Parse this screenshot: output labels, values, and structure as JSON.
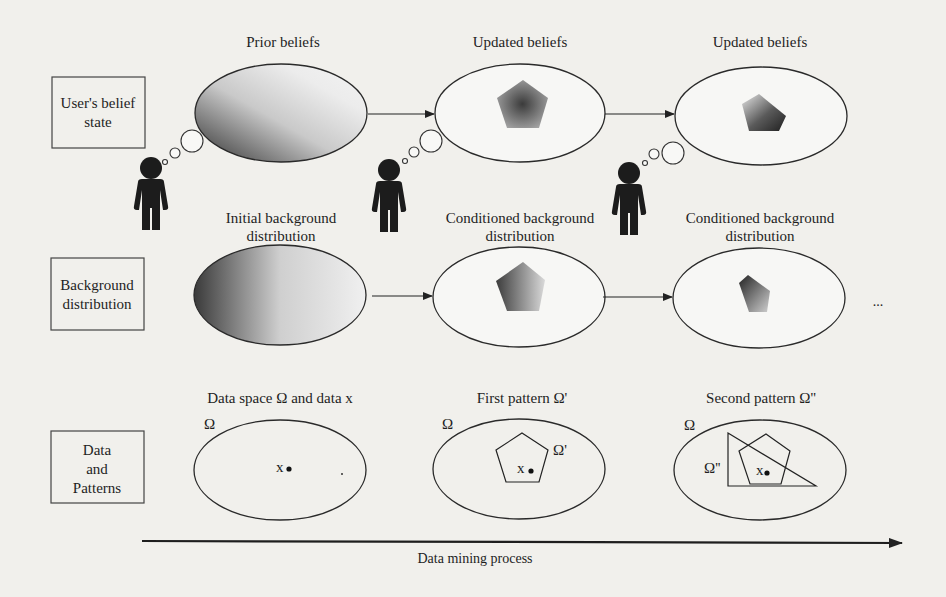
{
  "figure": {
    "rows": [
      {
        "id": "belief",
        "label_lines": [
          "User's belief",
          "state"
        ],
        "stages": [
          {
            "title_lines": [
              "Prior beliefs"
            ],
            "fill": "gradient-ellipse"
          },
          {
            "title_lines": [
              "Updated beliefs"
            ],
            "fill": "radial-pentagon"
          },
          {
            "title_lines": [
              "Updated beliefs"
            ],
            "fill": "cut-pentagon"
          }
        ]
      },
      {
        "id": "background",
        "label_lines": [
          "Background",
          "distribution"
        ],
        "stages": [
          {
            "title_lines": [
              "Initial background",
              "distribution"
            ],
            "fill": "gradient-ellipse"
          },
          {
            "title_lines": [
              "Conditioned background",
              "distribution"
            ],
            "fill": "gradient-pentagon"
          },
          {
            "title_lines": [
              "Conditioned background",
              "distribution"
            ],
            "fill": "cut-pentagon"
          }
        ],
        "continuation": "..."
      },
      {
        "id": "data",
        "label_lines": [
          "Data",
          "and",
          "Patterns"
        ],
        "stages": [
          {
            "title_lines": [
              "Data space Ω and data x"
            ],
            "space_label": "Ω",
            "point_label": "x"
          },
          {
            "title_lines": [
              "First pattern Ω'"
            ],
            "space_label": "Ω",
            "point_label": "x",
            "pattern_label": "Ω'"
          },
          {
            "title_lines": [
              "Second pattern Ω''"
            ],
            "space_label": "Ω",
            "point_label": "x",
            "pattern_label": "Ω''"
          }
        ]
      }
    ],
    "users": [
      {
        "icon": "person-thinking-icon"
      },
      {
        "icon": "person-thinking-icon"
      },
      {
        "icon": "person-thinking-icon"
      }
    ],
    "timeline": {
      "label": "Data mining process",
      "direction": "left-to-right"
    },
    "colors": {
      "background": "#f1f0ec",
      "stroke": "#222222",
      "shade_dark": "#3a3a3a",
      "shade_light": "#f2f2f2",
      "person": "#1c1c1c"
    }
  }
}
